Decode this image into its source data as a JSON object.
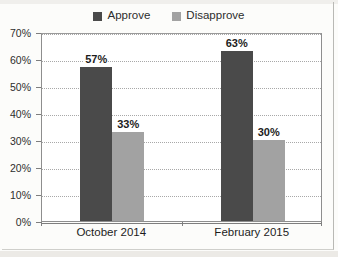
{
  "chart_data": {
    "type": "bar",
    "title": "",
    "xlabel": "",
    "ylabel": "",
    "categories": [
      "October 2014",
      "February 2015"
    ],
    "series": [
      {
        "name": "Approve",
        "values": [
          57,
          63
        ],
        "color": "#4a4a4a",
        "labels": [
          "57%",
          "63%"
        ]
      },
      {
        "name": "Disapprove",
        "values": [
          33,
          30
        ],
        "color": "#a2a2a2",
        "labels": [
          "33%",
          "30%"
        ]
      }
    ],
    "ylim": [
      0,
      70
    ],
    "y_tick_step": 10,
    "y_tick_labels": [
      "70%",
      "60%",
      "50%",
      "40%",
      "30%",
      "20%",
      "10%",
      "0%"
    ],
    "y_tick_values": [
      70,
      60,
      50,
      40,
      30,
      20,
      10,
      0
    ],
    "grid": true,
    "grid_style": "dotted-horizontal",
    "legend_position": "top-center",
    "value_labels_shown": true
  },
  "legend": {
    "entries": [
      {
        "label": "Approve",
        "color": "#4a4a4a"
      },
      {
        "label": "Disapprove",
        "color": "#a2a2a2"
      }
    ]
  },
  "colors": {
    "approve": "#4a4a4a",
    "disapprove": "#a2a2a2",
    "axis": "#7e7e7e",
    "grid": "#a8a8a8",
    "plot_background": "#ffffff",
    "page_background": "#fbfbf9",
    "text": "#1c1c1c"
  }
}
